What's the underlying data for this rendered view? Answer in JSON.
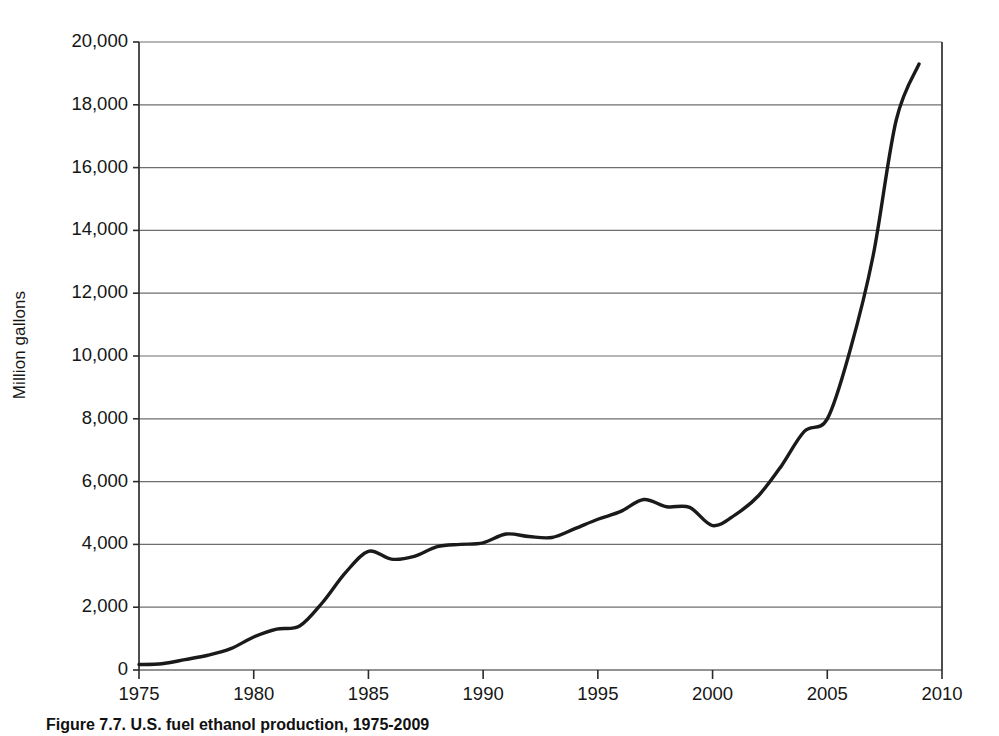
{
  "chart_data": {
    "type": "line",
    "title": "",
    "xlabel": "",
    "ylabel": "Million gallons",
    "xlim": [
      1975,
      2010
    ],
    "ylim": [
      0,
      20000
    ],
    "grid": true,
    "legend": null,
    "xticks": [
      "1975",
      "1980",
      "1985",
      "1990",
      "1995",
      "2000",
      "2005",
      "2010"
    ],
    "xtick_values": [
      1975,
      1980,
      1985,
      1990,
      1995,
      2000,
      2005,
      2010
    ],
    "yticks": [
      "0",
      "2,000",
      "4,000",
      "6,000",
      "8,000",
      "10,000",
      "12,000",
      "14,000",
      "16,000",
      "18,000",
      "20,000"
    ],
    "ytick_values": [
      0,
      2000,
      4000,
      6000,
      8000,
      10000,
      12000,
      14000,
      16000,
      18000,
      20000
    ],
    "line_color": "#1a1a1a",
    "line_width": 3.4,
    "series": [
      {
        "name": "Fuel ethanol production",
        "x": [
          1975,
          1976,
          1977,
          1978,
          1979,
          1980,
          1981,
          1982,
          1983,
          1984,
          1985,
          1986,
          1987,
          1988,
          1989,
          1990,
          1991,
          1992,
          1993,
          1994,
          1995,
          1996,
          1997,
          1998,
          1999,
          2000,
          2001,
          2002,
          2003,
          2004,
          2005,
          2006,
          2007,
          2008,
          2009
        ],
        "values": [
          175,
          200,
          330,
          470,
          680,
          1050,
          1300,
          1400,
          2150,
          3100,
          3780,
          3530,
          3620,
          3930,
          4000,
          4050,
          4330,
          4250,
          4220,
          4500,
          4800,
          5050,
          5430,
          5200,
          5180,
          4600,
          4950,
          5550,
          6500,
          7600,
          8000,
          10200,
          13200,
          17500,
          19300
        ]
      }
    ]
  },
  "axes": {
    "y_axis_title": "Million gallons"
  },
  "caption": {
    "text": "Figure 7.7. U.S. fuel ethanol production, 1975-2009"
  }
}
